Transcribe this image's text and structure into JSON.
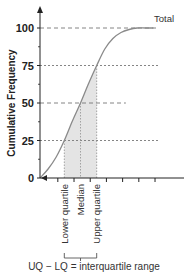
{
  "chart_data": {
    "type": "line",
    "title": "",
    "xlabel": "",
    "ylabel": "Cumulative Frequency",
    "ylim": [
      0,
      100
    ],
    "xlim": [
      0,
      7.6
    ],
    "y_ticks": [
      0,
      25,
      50,
      75,
      100
    ],
    "y_tick_labels": [
      "0",
      "25",
      "50",
      "75",
      "100"
    ],
    "x_ticks": [
      0,
      1,
      2,
      3,
      4,
      5,
      6
    ],
    "grid": false,
    "curve": {
      "name": "Cumulative frequency curve",
      "x": [
        0,
        0.5,
        1,
        1.5,
        2,
        2.5,
        3,
        3.5,
        4,
        4.5,
        5,
        5.5,
        6,
        6.5,
        7
      ],
      "y": [
        0,
        6,
        14,
        25,
        38,
        50,
        63,
        75,
        86,
        93,
        97,
        99,
        100,
        100,
        100
      ]
    },
    "reference_lines": [
      {
        "value": 100,
        "style": "dashed",
        "label": "Total",
        "extent_x": 7.2
      },
      {
        "value": 75,
        "style": "dotted",
        "extent_x": 7.3
      },
      {
        "value": 50,
        "style": "dashed",
        "extent_x": 5.3
      },
      {
        "value": 25,
        "style": "dotted",
        "extent_x": 7.3
      }
    ],
    "quartiles": [
      {
        "name": "Lower quartile",
        "x": 1.5,
        "y": 25
      },
      {
        "name": "Median",
        "x": 2.5,
        "y": 50
      },
      {
        "name": "Upper quartile",
        "x": 3.5,
        "y": 75
      }
    ],
    "shaded_region": {
      "from_x": 1.5,
      "to_x": 3.5,
      "meaning": "interquartile range"
    },
    "annotations": {
      "total_label": "Total",
      "iqr_formula": "UQ − LQ = interquartile range"
    },
    "colors": {
      "axis": "#222222",
      "curve": "#8a8a8a",
      "dashed": "#777777",
      "shade": "#e4e4e4"
    }
  }
}
